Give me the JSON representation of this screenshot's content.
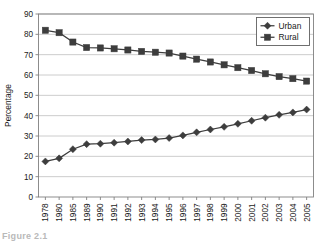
{
  "figure": {
    "caption": "Figure 2.1"
  },
  "legend": {
    "position": "top-right",
    "entries": [
      {
        "label": "Urban",
        "marker": "diamond-marker",
        "color": "#3d3d3d"
      },
      {
        "label": "Rural",
        "marker": "square-marker",
        "color": "#3d3d3d"
      }
    ]
  },
  "chart_data": {
    "type": "line",
    "title": "",
    "xlabel": "",
    "ylabel": "Percentage",
    "ylim": [
      0,
      90
    ],
    "yticks": [
      0,
      10,
      20,
      30,
      40,
      50,
      60,
      70,
      80,
      90
    ],
    "grid": true,
    "grid_axis": "y",
    "categories": [
      "1978",
      "1980",
      "1985",
      "1989",
      "1990",
      "1991",
      "1992",
      "1993",
      "1994",
      "1995",
      "1996",
      "1997",
      "1998",
      "1999",
      "2000",
      "2001",
      "2002",
      "2003",
      "2004",
      "2005"
    ],
    "series": [
      {
        "name": "Urban",
        "marker": "diamond",
        "color": "#3d3d3d",
        "values": [
          17.5,
          19.0,
          23.5,
          26.0,
          26.2,
          26.7,
          27.3,
          28.0,
          28.3,
          29.0,
          30.3,
          31.8,
          33.2,
          34.5,
          36.0,
          37.5,
          39.0,
          40.4,
          41.6,
          43.0
        ]
      },
      {
        "name": "Rural",
        "marker": "square",
        "color": "#3d3d3d",
        "values": [
          82.0,
          80.8,
          76.2,
          73.5,
          73.3,
          72.9,
          72.3,
          71.6,
          71.2,
          70.8,
          69.3,
          67.8,
          66.4,
          65.0,
          63.6,
          62.2,
          60.6,
          59.2,
          58.2,
          57.0
        ]
      }
    ]
  },
  "colors": {
    "series_ink": "#3d3d3d",
    "grid": "#bfbfbf",
    "axis": "#808080",
    "text": "#1a1a1a",
    "plot_background": "#ffffff"
  }
}
